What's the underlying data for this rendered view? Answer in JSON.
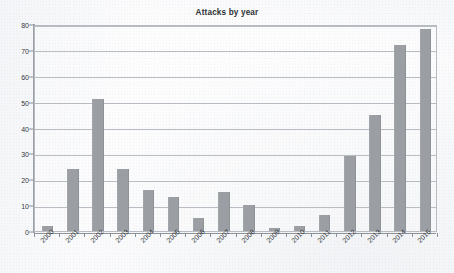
{
  "chart_data": {
    "type": "bar",
    "title": "Attacks by year",
    "xlabel": "",
    "ylabel": "",
    "categories": [
      "2000",
      "2001",
      "2002",
      "2003",
      "2004",
      "2005",
      "2006",
      "2007",
      "2008",
      "2009",
      "2010",
      "2011",
      "2012",
      "2013",
      "2014",
      "2015"
    ],
    "values": [
      2,
      24,
      51,
      24,
      16,
      13,
      5,
      15,
      10,
      1,
      2,
      6,
      29,
      45,
      72,
      78
    ],
    "ylim": [
      0,
      80
    ],
    "ytick_values": [
      0,
      10,
      20,
      30,
      40,
      50,
      60,
      70,
      80
    ],
    "ytick_labels": [
      "0",
      "10",
      "20",
      "30",
      "40",
      "50",
      "60",
      "70",
      "80"
    ],
    "grid": true,
    "grid_axis": "y",
    "legend": false,
    "legend_position": "none",
    "bar_color": "#9b9fa3",
    "gridline_color": "#b9bdc3",
    "axis_color": "#9aa0a6",
    "text_color": "#2f3236",
    "background_color": "#fcfcfd",
    "xtick_label_rotation": -45
  }
}
